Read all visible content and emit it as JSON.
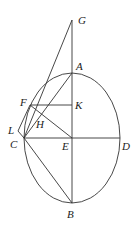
{
  "diagram": {
    "labels": {
      "G": "G",
      "A": "A",
      "F": "F",
      "K": "K",
      "H": "H",
      "L": "L",
      "C": "C",
      "E": "E",
      "D": "D",
      "B": "B"
    },
    "stroke_color": "#333333"
  }
}
